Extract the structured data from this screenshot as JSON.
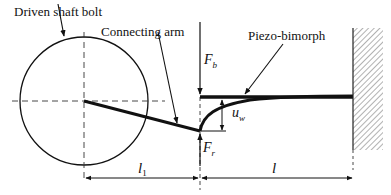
{
  "diagram": {
    "type": "mechanical-schematic",
    "labels": {
      "driven_shaft_bolt": "Driven shaft bolt",
      "connecting_arm": "Connecting arm",
      "piezo_bimorph": "Piezo-bimorph"
    },
    "symbols": {
      "force_b": "F",
      "force_b_sub": "b",
      "force_r": "F",
      "force_r_sub": "r",
      "deflection": "u",
      "deflection_sub": "w",
      "length_1": "l",
      "length_1_sub": "1",
      "length": "l"
    },
    "colors": {
      "stroke": "#111111",
      "background": "#ffffff",
      "hatch": "#555555"
    }
  }
}
